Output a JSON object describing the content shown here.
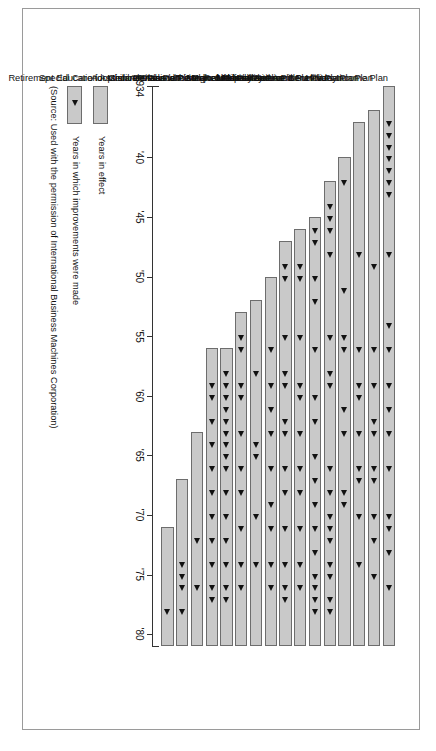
{
  "figure": {
    "orientation": "rotated-90-clockwise",
    "frame_border_color": "#9a9a9a",
    "bar_fill": "#c9c9c9",
    "bar_border": "#6d6d6d",
    "marker_color": "#111111"
  },
  "legend": {
    "items": [
      {
        "swatch": "bar",
        "label": "Years in effect"
      },
      {
        "swatch": "bar-with-marker",
        "label": "Years in which improvements were made"
      }
    ]
  },
  "source_note": "(Source: Used with the permission of International Business Machines Corporation)",
  "axis": {
    "tick_labels": [
      "1934",
      "'40",
      "'45",
      "'50",
      "'55",
      "'60",
      "'65",
      "'70",
      "'75",
      "'80"
    ],
    "tick_values": [
      1934,
      1940,
      1945,
      1950,
      1955,
      1960,
      1965,
      1970,
      1975,
      1980
    ],
    "min": 1934,
    "max": 1981
  },
  "chart_data": {
    "type": "bar",
    "title": "",
    "subtitle": "",
    "xlabel": "",
    "ylabel": "",
    "xlim": [
      1934,
      1981
    ],
    "grid": false,
    "legend_position": "below-left",
    "categories": [
      "Life Insurance and Survivors Income Plan",
      "Vacation Plan",
      "Holiday Plan",
      "Military Service Benefits Plan",
      "Sickness and Accident Plan",
      "Retirement Plan",
      "Hospitalization Plan",
      "Total and Permanent Disability Plan",
      "Major Medical Plan",
      "Tuition Refund Plan",
      "Surgical Plan",
      "Medical Plans with Medicare",
      "Special Care for Children Assistance Plan",
      "Adoption Assistance Plan",
      "Dental Plan",
      "Retirement Education Assistance Plan"
    ],
    "series": [
      {
        "name": "Years in effect",
        "bars": [
          {
            "category": "Life Insurance and Survivors Income Plan",
            "start": 1934,
            "end": 1981,
            "improvements": [
              1937,
              1938,
              1939,
              1940,
              1941,
              1942,
              1943,
              1948,
              1954,
              1956,
              1959,
              1961,
              1963,
              1966,
              1970,
              1971,
              1973,
              1976
            ]
          },
          {
            "category": "Vacation Plan",
            "start": 1936,
            "end": 1981,
            "improvements": [
              1949,
              1956,
              1959,
              1962,
              1963,
              1966,
              1967,
              1970,
              1972,
              1975
            ]
          },
          {
            "category": "Holiday Plan",
            "start": 1937,
            "end": 1981,
            "improvements": [
              1948,
              1956,
              1959,
              1960,
              1963,
              1966,
              1967,
              1970,
              1974
            ]
          },
          {
            "category": "Military Service Benefits Plan",
            "start": 1940,
            "end": 1981,
            "improvements": [
              1942,
              1951,
              1955,
              1956,
              1961,
              1963,
              1968,
              1969
            ]
          },
          {
            "category": "Sickness and Accident Plan",
            "start": 1942,
            "end": 1981,
            "improvements": [
              1944,
              1945,
              1946,
              1948,
              1955,
              1958,
              1959,
              1966,
              1968,
              1970,
              1971,
              1972,
              1974,
              1975,
              1977,
              1978
            ]
          },
          {
            "category": "Retirement Plan",
            "start": 1945,
            "end": 1981,
            "improvements": [
              1946,
              1947,
              1950,
              1952,
              1956,
              1960,
              1962,
              1965,
              1967,
              1969,
              1971,
              1973,
              1975,
              1976,
              1977,
              1978
            ]
          },
          {
            "category": "Hospitalization Plan",
            "start": 1946,
            "end": 1981,
            "improvements": [
              1949,
              1950,
              1955,
              1959,
              1960,
              1963,
              1966,
              1968,
              1971,
              1974,
              1976
            ]
          },
          {
            "category": "Total and Permanent Disability Plan",
            "start": 1947,
            "end": 1981,
            "improvements": [
              1949,
              1950,
              1955,
              1958,
              1959,
              1962,
              1963,
              1966,
              1968,
              1971,
              1974,
              1976,
              1977
            ]
          },
          {
            "category": "Major Medical Plan",
            "start": 1950,
            "end": 1981,
            "improvements": [
              1956,
              1959,
              1961,
              1963,
              1966,
              1969,
              1971,
              1974,
              1976
            ]
          },
          {
            "category": "Tuition Refund Plan",
            "start": 1952,
            "end": 1981,
            "improvements": [
              1958,
              1964,
              1965,
              1970,
              1974
            ]
          },
          {
            "category": "Surgical Plan",
            "start": 1953,
            "end": 1981,
            "improvements": [
              1955,
              1956,
              1959,
              1960,
              1963,
              1966,
              1968,
              1971,
              1974,
              1976
            ]
          },
          {
            "category": "Medical Plans with Medicare",
            "start": 1956,
            "end": 1981,
            "improvements": [
              1958,
              1959,
              1960,
              1961,
              1962,
              1963,
              1964,
              1965,
              1966,
              1968,
              1970,
              1972,
              1974,
              1976,
              1977
            ]
          },
          {
            "category": "Special Care for Children Assistance Plan",
            "start": 1956,
            "end": 1981,
            "improvements": [
              1959,
              1960,
              1962,
              1964,
              1966,
              1968,
              1970,
              1972,
              1974,
              1976,
              1977
            ]
          },
          {
            "category": "Adoption Assistance Plan",
            "start": 1963,
            "end": 1981,
            "improvements": [
              1972,
              1976
            ]
          },
          {
            "category": "Dental Plan",
            "start": 1967,
            "end": 1981,
            "improvements": [
              1974,
              1975,
              1976,
              1978
            ]
          },
          {
            "category": "Retirement Education Assistance Plan",
            "start": 1971,
            "end": 1981,
            "improvements": [
              1978
            ]
          }
        ]
      }
    ]
  }
}
